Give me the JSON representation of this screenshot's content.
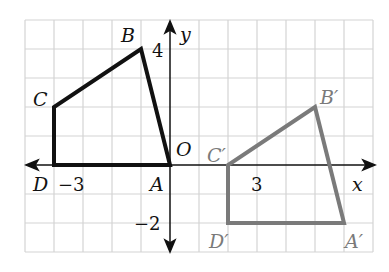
{
  "figure": {
    "grid": {
      "x_min": -5,
      "x_max": 7,
      "y_min": -3,
      "y_max": 5,
      "origin_px": [
        170,
        165
      ],
      "unit_px": 29,
      "line_color": "#d4d4d4"
    },
    "axes": {
      "x_label": "x",
      "y_label": "y",
      "origin_label": "O",
      "tick_labels": [
        {
          "text": "4",
          "axis": "y",
          "value": 4
        },
        {
          "text": "−2",
          "axis": "y",
          "value": -2
        },
        {
          "text": "−3",
          "axis": "x",
          "value": -3
        },
        {
          "text": "3",
          "axis": "x",
          "value": 3
        }
      ],
      "color": "#111111"
    },
    "preimage": {
      "name": "ABCD",
      "color": "#111111",
      "vertices": [
        {
          "label": "A",
          "x": 0,
          "y": 0
        },
        {
          "label": "B",
          "x": -1,
          "y": 4
        },
        {
          "label": "C",
          "x": -4,
          "y": 2
        },
        {
          "label": "D",
          "x": -4,
          "y": 0
        }
      ]
    },
    "image": {
      "name": "A'B'C'D'",
      "color": "#7a7a7a",
      "vertices": [
        {
          "label": "A′",
          "x": 6,
          "y": -2
        },
        {
          "label": "B′",
          "x": 5,
          "y": 2
        },
        {
          "label": "C′",
          "x": 2,
          "y": 0
        },
        {
          "label": "D′",
          "x": 2,
          "y": -2
        }
      ]
    }
  }
}
